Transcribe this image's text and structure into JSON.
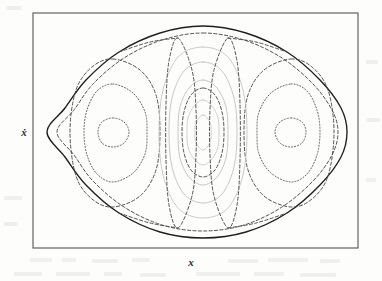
{
  "figure": {
    "title": "",
    "type": "contour-plot",
    "axes": {
      "xlabel": "x",
      "ylabel": "ẋ",
      "frame": {
        "left": 33,
        "top": 13,
        "right": 358,
        "bottom": 248
      },
      "ticks_visible": false,
      "grid": false
    },
    "render": {
      "background": "#fdfdfc",
      "frame_color": "#555555",
      "separatrix_color": "#1e1e1e",
      "dashed_contour_color": "#4a4a4a",
      "light_contour_color": "#b9b9b9",
      "dotted_contour_color": "#5a5a5a"
    }
  },
  "chart_data": {
    "type": "line",
    "title": "",
    "xlabel": "x",
    "ylabel": "ẋ",
    "xlim": [
      -1,
      1
    ],
    "ylim": [
      -1,
      1
    ],
    "grid": false,
    "legend": "none",
    "series": [
      {
        "name": "outer-separatrix",
        "style": "solid",
        "color": "#1e1e1e",
        "closed": true,
        "points": [
          [
            203,
            26
          ],
          [
            246,
            33
          ],
          [
            287,
            52
          ],
          [
            320,
            80
          ],
          [
            341,
            108
          ],
          [
            347,
            132
          ],
          [
            341,
            157
          ],
          [
            320,
            185
          ],
          [
            287,
            213
          ],
          [
            246,
            232
          ],
          [
            203,
            238
          ],
          [
            160,
            232
          ],
          [
            119,
            213
          ],
          [
            86,
            185
          ],
          [
            65,
            157
          ],
          [
            47,
            132
          ],
          [
            65,
            108
          ],
          [
            86,
            80
          ],
          [
            119,
            52
          ],
          [
            160,
            33
          ]
        ]
      },
      {
        "name": "outer-dashed-1",
        "style": "dashed",
        "color": "#4a4a4a",
        "closed": true,
        "points": [
          [
            203,
            33
          ],
          [
            244,
            40
          ],
          [
            282,
            58
          ],
          [
            313,
            84
          ],
          [
            332,
            110
          ],
          [
            338,
            132
          ],
          [
            332,
            155
          ],
          [
            313,
            181
          ],
          [
            282,
            207
          ],
          [
            244,
            225
          ],
          [
            203,
            231
          ],
          [
            162,
            225
          ],
          [
            124,
            207
          ],
          [
            93,
            181
          ],
          [
            74,
            155
          ],
          [
            57,
            132
          ],
          [
            74,
            110
          ],
          [
            93,
            84
          ],
          [
            124,
            58
          ],
          [
            162,
            40
          ]
        ]
      },
      {
        "name": "left-island-outer",
        "style": "dashed",
        "color": "#4a4a4a",
        "closed": true,
        "points": [
          [
            113,
            59
          ],
          [
            140,
            70
          ],
          [
            156,
            95
          ],
          [
            160,
            132
          ],
          [
            156,
            170
          ],
          [
            140,
            196
          ],
          [
            113,
            207
          ],
          [
            92,
            199
          ],
          [
            76,
            176
          ],
          [
            70,
            132
          ],
          [
            76,
            90
          ],
          [
            92,
            67
          ]
        ]
      },
      {
        "name": "left-island-mid",
        "style": "dotted",
        "color": "#5a5a5a",
        "closed": true,
        "points": [
          [
            113,
            84
          ],
          [
            133,
            93
          ],
          [
            145,
            112
          ],
          [
            147,
            132
          ],
          [
            145,
            154
          ],
          [
            133,
            173
          ],
          [
            113,
            182
          ],
          [
            97,
            174
          ],
          [
            87,
            155
          ],
          [
            84,
            132
          ],
          [
            87,
            110
          ],
          [
            97,
            91
          ]
        ]
      },
      {
        "name": "left-island-inner",
        "style": "dotted",
        "color": "#5a5a5a",
        "closed": true,
        "points": [
          [
            113,
            118
          ],
          [
            124,
            122
          ],
          [
            129,
            132
          ],
          [
            124,
            143
          ],
          [
            113,
            147
          ],
          [
            102,
            143
          ],
          [
            98,
            132
          ],
          [
            102,
            122
          ]
        ]
      },
      {
        "name": "right-island-outer",
        "style": "dashed",
        "color": "#4a4a4a",
        "closed": true,
        "points": [
          [
            291,
            59
          ],
          [
            312,
            67
          ],
          [
            328,
            90
          ],
          [
            334,
            132
          ],
          [
            328,
            176
          ],
          [
            312,
            199
          ],
          [
            291,
            207
          ],
          [
            264,
            196
          ],
          [
            248,
            170
          ],
          [
            244,
            132
          ],
          [
            248,
            95
          ],
          [
            264,
            70
          ]
        ]
      },
      {
        "name": "right-island-mid",
        "style": "dotted",
        "color": "#5a5a5a",
        "closed": true,
        "points": [
          [
            291,
            84
          ],
          [
            307,
            91
          ],
          [
            317,
            110
          ],
          [
            320,
            132
          ],
          [
            317,
            155
          ],
          [
            307,
            174
          ],
          [
            291,
            182
          ],
          [
            271,
            173
          ],
          [
            259,
            154
          ],
          [
            257,
            132
          ],
          [
            259,
            112
          ],
          [
            271,
            93
          ]
        ]
      },
      {
        "name": "right-island-inner",
        "style": "dotted",
        "color": "#5a5a5a",
        "closed": true,
        "points": [
          [
            291,
            118
          ],
          [
            302,
            122
          ],
          [
            306,
            132
          ],
          [
            302,
            143
          ],
          [
            291,
            147
          ],
          [
            280,
            143
          ],
          [
            275,
            132
          ],
          [
            280,
            122
          ]
        ]
      },
      {
        "name": "centre-ellipse-1",
        "style": "solid",
        "color": "#c2c2c2",
        "closed": true,
        "points": [
          [
            203,
            47
          ],
          [
            228,
            57
          ],
          [
            243,
            90
          ],
          [
            247,
            132
          ],
          [
            243,
            175
          ],
          [
            228,
            208
          ],
          [
            203,
            218
          ],
          [
            178,
            208
          ],
          [
            163,
            175
          ],
          [
            159,
            132
          ],
          [
            163,
            90
          ],
          [
            178,
            57
          ]
        ]
      },
      {
        "name": "centre-ellipse-2",
        "style": "solid",
        "color": "#bdbdbd",
        "closed": true,
        "points": [
          [
            203,
            62
          ],
          [
            222,
            71
          ],
          [
            234,
            98
          ],
          [
            237,
            132
          ],
          [
            234,
            167
          ],
          [
            222,
            194
          ],
          [
            203,
            203
          ],
          [
            184,
            194
          ],
          [
            172,
            167
          ],
          [
            169,
            132
          ],
          [
            172,
            98
          ],
          [
            184,
            71
          ]
        ]
      },
      {
        "name": "centre-ellipse-3",
        "style": "solid",
        "color": "#bdbdbd",
        "closed": true,
        "points": [
          [
            203,
            80
          ],
          [
            217,
            88
          ],
          [
            226,
            107
          ],
          [
            228,
            132
          ],
          [
            226,
            158
          ],
          [
            217,
            177
          ],
          [
            203,
            185
          ],
          [
            189,
            177
          ],
          [
            180,
            158
          ],
          [
            178,
            132
          ],
          [
            180,
            107
          ],
          [
            189,
            88
          ]
        ]
      },
      {
        "name": "centre-ellipse-4",
        "style": "solid",
        "color": "#c7c7c7",
        "closed": true,
        "points": [
          [
            203,
            100
          ],
          [
            212,
            106
          ],
          [
            218,
            118
          ],
          [
            219,
            132
          ],
          [
            218,
            147
          ],
          [
            212,
            159
          ],
          [
            203,
            165
          ],
          [
            194,
            159
          ],
          [
            188,
            147
          ],
          [
            187,
            132
          ],
          [
            188,
            118
          ],
          [
            194,
            106
          ]
        ]
      },
      {
        "name": "centre-ellipse-inner",
        "style": "solid",
        "color": "#c7c7c7",
        "closed": true,
        "points": [
          [
            203,
            115
          ],
          [
            208,
            119
          ],
          [
            211,
            126
          ],
          [
            211,
            132
          ],
          [
            211,
            139
          ],
          [
            208,
            146
          ],
          [
            203,
            150
          ],
          [
            198,
            146
          ],
          [
            195,
            139
          ],
          [
            195,
            132
          ],
          [
            195,
            126
          ],
          [
            198,
            119
          ]
        ]
      },
      {
        "name": "centre-separatrix-left",
        "style": "dashed",
        "color": "#4a4a4a",
        "closed": true,
        "points": [
          [
            178,
            38
          ],
          [
            192,
            70
          ],
          [
            196,
            110
          ],
          [
            196,
            155
          ],
          [
            192,
            196
          ],
          [
            178,
            228
          ],
          [
            169,
            205
          ],
          [
            166,
            160
          ],
          [
            166,
            104
          ],
          [
            169,
            61
          ]
        ]
      },
      {
        "name": "centre-separatrix-right",
        "style": "dashed",
        "color": "#4a4a4a",
        "closed": true,
        "points": [
          [
            228,
            38
          ],
          [
            237,
            61
          ],
          [
            240,
            104
          ],
          [
            240,
            160
          ],
          [
            237,
            205
          ],
          [
            228,
            228
          ],
          [
            214,
            196
          ],
          [
            210,
            155
          ],
          [
            210,
            110
          ],
          [
            214,
            70
          ]
        ]
      },
      {
        "name": "centre-mid-dashed",
        "style": "dashed",
        "color": "#4a4a4a",
        "closed": true,
        "points": [
          [
            203,
            88
          ],
          [
            215,
            95
          ],
          [
            222,
            112
          ],
          [
            224,
            132
          ],
          [
            222,
            153
          ],
          [
            215,
            170
          ],
          [
            203,
            177
          ],
          [
            191,
            170
          ],
          [
            184,
            153
          ],
          [
            182,
            132
          ],
          [
            184,
            112
          ],
          [
            191,
            95
          ]
        ]
      },
      {
        "name": "upper-lobe-dashed-left",
        "style": "dashed",
        "color": "#4a4a4a",
        "closed": false,
        "points": [
          [
            119,
            52
          ],
          [
            150,
            42
          ],
          [
            178,
            38
          ]
        ]
      },
      {
        "name": "upper-lobe-dashed-right",
        "style": "dashed",
        "color": "#4a4a4a",
        "closed": false,
        "points": [
          [
            228,
            38
          ],
          [
            256,
            42
          ],
          [
            287,
            52
          ]
        ]
      },
      {
        "name": "lower-lobe-dashed-left",
        "style": "dashed",
        "color": "#4a4a4a",
        "closed": false,
        "points": [
          [
            119,
            213
          ],
          [
            150,
            223
          ],
          [
            178,
            228
          ]
        ]
      },
      {
        "name": "lower-lobe-dashed-right",
        "style": "dashed",
        "color": "#4a4a4a",
        "closed": false,
        "points": [
          [
            228,
            228
          ],
          [
            256,
            223
          ],
          [
            287,
            213
          ]
        ]
      }
    ]
  }
}
